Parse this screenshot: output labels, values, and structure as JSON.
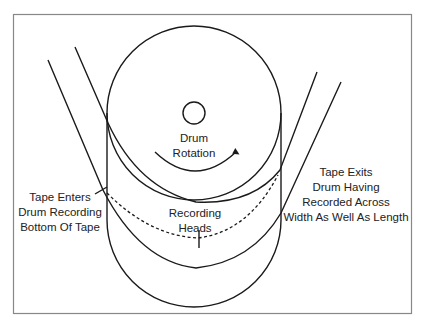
{
  "diagram": {
    "labels": {
      "drum_rotation": [
        "Drum",
        "Rotation"
      ],
      "recording_heads": [
        "Recording",
        "Heads"
      ],
      "tape_enters": [
        "Tape Enters",
        "Drum Recording",
        "Bottom Of Tape"
      ],
      "tape_exits": [
        "Tape Exits",
        "Drum Having",
        "Recorded Across",
        "Width As Well As Length"
      ]
    },
    "colors": {
      "line": "#1a1a1a",
      "frame": "#888888",
      "background": "#ffffff"
    }
  }
}
